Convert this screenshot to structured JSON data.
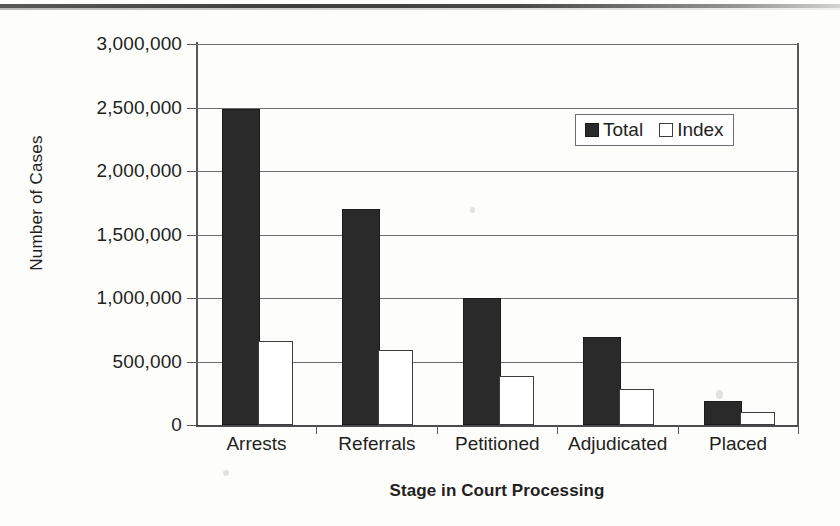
{
  "chart_data": {
    "type": "bar",
    "title": "",
    "xlabel": "Stage in Court Processing",
    "ylabel": "Number of Cases",
    "categories": [
      "Arrests",
      "Referrals",
      "Petitioned",
      "Adjudicated",
      "Placed"
    ],
    "series": [
      {
        "name": "Total",
        "values": [
          2470000,
          1685000,
          985000,
          675000,
          175000
        ]
      },
      {
        "name": "Index",
        "values": [
          645000,
          575000,
          370000,
          270000,
          90000
        ]
      }
    ],
    "ylim": [
      0,
      3000000
    ],
    "ytick_values": [
      0,
      500000,
      1000000,
      1500000,
      2000000,
      2500000,
      3000000
    ],
    "ytick_labels": [
      "0",
      "500,000",
      "1,000,000",
      "1,500,000",
      "2,000,000",
      "2,500,000",
      "3,000,000"
    ],
    "grid": true,
    "legend": {
      "position": "inside-top-right",
      "entries": [
        {
          "label": "Total",
          "color": "#2b2a2a",
          "filled": true
        },
        {
          "label": "Index",
          "color": "#ffffff",
          "filled": false
        }
      ]
    },
    "colors": {
      "total": "#2b2a2a",
      "index": "#ffffff",
      "axis": "#58585b",
      "grid": "#6d6e71",
      "text": "#231f20"
    }
  }
}
